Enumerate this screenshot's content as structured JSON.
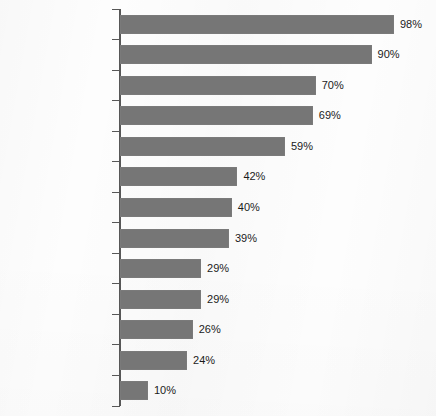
{
  "chart_data": {
    "type": "bar",
    "orientation": "horizontal",
    "title": "",
    "subtitle": "",
    "xlabel": "",
    "ylabel": "",
    "xlim": [
      0,
      100
    ],
    "grid": false,
    "legend": null,
    "value_suffix": "%",
    "bar_color": "#767676",
    "axis_color": "#575757",
    "text_color": "#1b1b1b",
    "background_color": "#fdfdfd",
    "categories": [
      "Color TV",
      "VCRs",
      "Cordless Phones",
      "CD Players",
      "Color TV with Stereo",
      "Computers",
      "Computer Printers",
      "Cellular Phones",
      "Car Alarm Systems",
      "Camcorders",
      "PCs with CD-ROM",
      "Modem or Fax/Modem",
      "Satellite Dishes"
    ],
    "values": [
      98,
      90,
      70,
      69,
      59,
      42,
      40,
      39,
      29,
      29,
      26,
      24,
      10
    ],
    "value_labels": [
      "98%",
      "90%",
      "70%",
      "69%",
      "59%",
      "42%",
      "40%",
      "39%",
      "29%",
      "29%",
      "26%",
      "24%",
      "10%"
    ]
  }
}
